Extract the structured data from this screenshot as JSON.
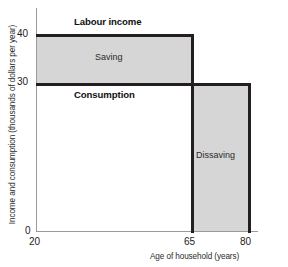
{
  "chart_data": {
    "type": "area",
    "title": "",
    "xlabel": "Age of household (years)",
    "ylabel": "Income and consumption (thousands of dollars per year)",
    "xlim": [
      20,
      85
    ],
    "ylim": [
      0,
      44
    ],
    "xticks": [
      "20",
      "65",
      "80"
    ],
    "xtick_values": [
      20,
      65,
      80
    ],
    "yticks": [
      "0",
      "30",
      "40"
    ],
    "ytick_values": [
      0,
      30,
      40
    ],
    "grid": false,
    "legend": "none",
    "series": [
      {
        "name": "Labour income",
        "type": "step",
        "x": [
          20,
          65,
          65,
          80
        ],
        "values": [
          40,
          40,
          0,
          0
        ]
      },
      {
        "name": "Consumption",
        "type": "step",
        "x": [
          20,
          65,
          65,
          80
        ],
        "values": [
          30,
          30,
          30,
          30
        ]
      }
    ],
    "regions": [
      {
        "name": "Saving",
        "label": "Saving",
        "x_range": [
          20,
          65
        ],
        "y_range": [
          30,
          40
        ],
        "fill": "#d6d6d6"
      },
      {
        "name": "Dissaving",
        "label": "Dissaving",
        "x_range": [
          65,
          80
        ],
        "y_range": [
          0,
          30
        ],
        "fill": "#d6d6d6"
      }
    ],
    "annotations": [
      {
        "text": "Labour income",
        "bold": true,
        "x": 34,
        "y": 41.5
      },
      {
        "text": "Saving",
        "bold": false,
        "x": 42,
        "y": 34.5
      },
      {
        "text": "Consumption",
        "bold": true,
        "x": 34,
        "y": 28.5
      },
      {
        "text": "Dissaving",
        "bold": false,
        "x": 71,
        "y": 16
      }
    ],
    "colors": {
      "fill": "#d6d6d6",
      "line": "#231f20",
      "axis": "#9a9a9a",
      "text": "#1c1c1c",
      "background": "#ffffff"
    }
  },
  "axes": {
    "y_label": "Income and consumption (thousands of dollars per year)",
    "x_label": "Age of household (years)",
    "y_ticks": {
      "t40": "40",
      "t30": "30",
      "t0": "0"
    },
    "x_ticks": {
      "t20": "20",
      "t65": "65",
      "t80": "80"
    }
  },
  "annotations": {
    "labour_income": "Labour income",
    "saving": "Saving",
    "consumption": "Consumption",
    "dissaving": "Dissaving"
  }
}
